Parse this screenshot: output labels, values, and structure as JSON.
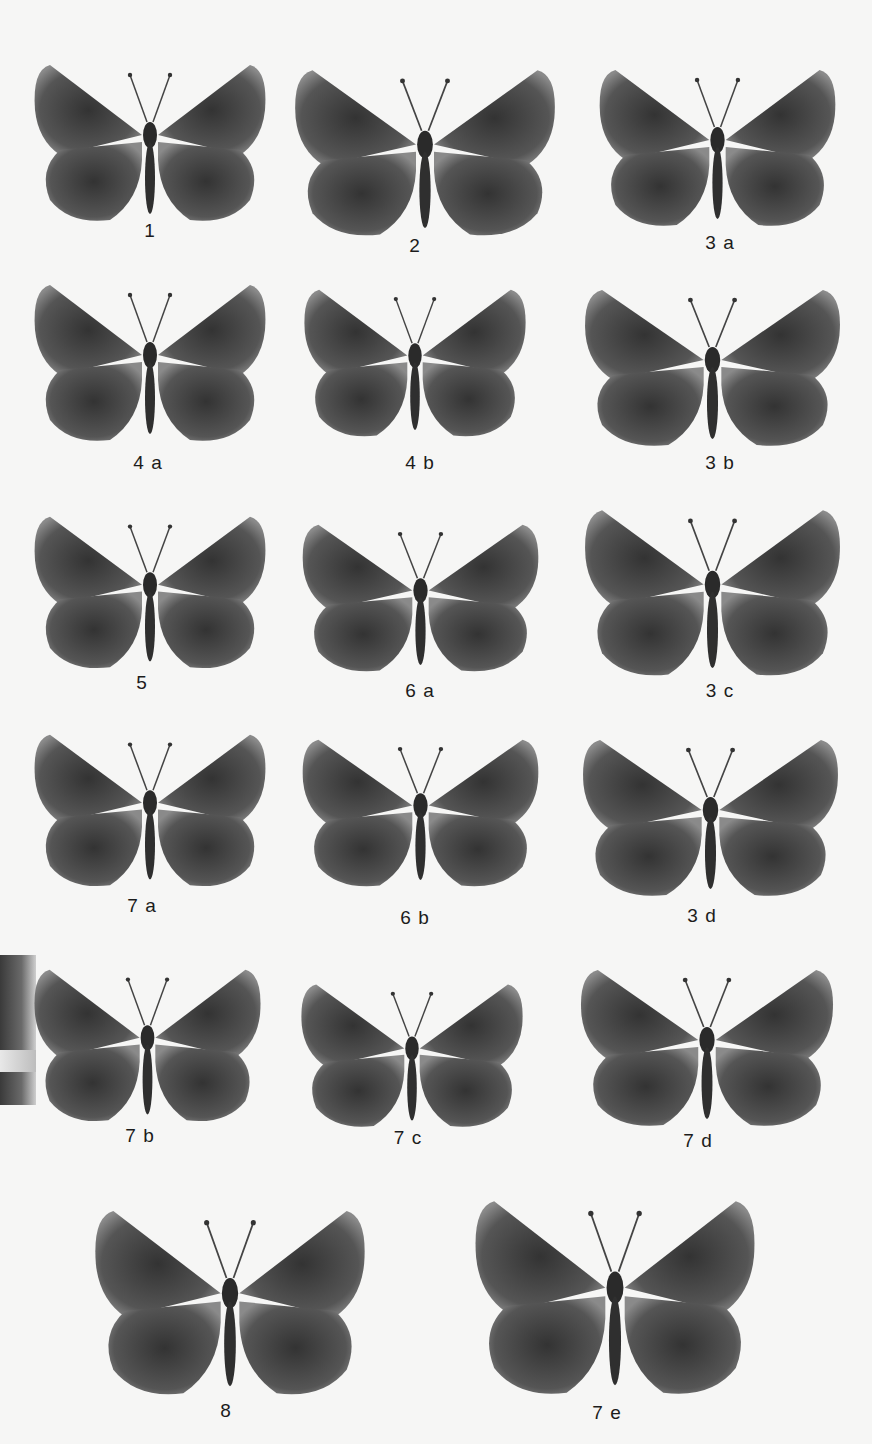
{
  "plate": {
    "colors": {
      "background": "#f6f6f5",
      "wing": "#5a5a5a",
      "wing_dark": "#3b3b3b",
      "label": "#1c1c1c"
    },
    "specimens": [
      {
        "label": "1",
        "x": 30,
        "y": 60,
        "w": 240,
        "h": 170,
        "lx": 120,
        "ly": 220
      },
      {
        "label": "2",
        "x": 290,
        "y": 65,
        "w": 270,
        "h": 180,
        "lx": 385,
        "ly": 235
      },
      {
        "label": "3 a",
        "x": 595,
        "y": 65,
        "w": 245,
        "h": 170,
        "lx": 690,
        "ly": 232
      },
      {
        "label": "4 a",
        "x": 30,
        "y": 280,
        "w": 240,
        "h": 170,
        "lx": 118,
        "ly": 452
      },
      {
        "label": "4 b",
        "x": 300,
        "y": 285,
        "w": 230,
        "h": 160,
        "lx": 390,
        "ly": 452
      },
      {
        "label": "3 b",
        "x": 580,
        "y": 285,
        "w": 265,
        "h": 170,
        "lx": 690,
        "ly": 452
      },
      {
        "label": "5",
        "x": 30,
        "y": 512,
        "w": 240,
        "h": 165,
        "lx": 112,
        "ly": 672
      },
      {
        "label": "6 a",
        "x": 298,
        "y": 520,
        "w": 245,
        "h": 160,
        "lx": 390,
        "ly": 680
      },
      {
        "label": "3 c",
        "x": 580,
        "y": 505,
        "w": 265,
        "h": 180,
        "lx": 690,
        "ly": 680
      },
      {
        "label": "7 a",
        "x": 30,
        "y": 730,
        "w": 240,
        "h": 165,
        "lx": 112,
        "ly": 895
      },
      {
        "label": "6 b",
        "x": 298,
        "y": 735,
        "w": 245,
        "h": 160,
        "lx": 385,
        "ly": 907
      },
      {
        "label": "3 d",
        "x": 578,
        "y": 735,
        "w": 265,
        "h": 170,
        "lx": 672,
        "ly": 905
      },
      {
        "label": "7 b",
        "x": 30,
        "y": 965,
        "w": 235,
        "h": 165,
        "lx": 110,
        "ly": 1125
      },
      {
        "label": "7 c",
        "x": 297,
        "y": 980,
        "w": 230,
        "h": 155,
        "lx": 378,
        "ly": 1127
      },
      {
        "label": "7 d",
        "x": 576,
        "y": 965,
        "w": 262,
        "h": 170,
        "lx": 668,
        "ly": 1130
      },
      {
        "label": "8",
        "x": 90,
        "y": 1205,
        "w": 280,
        "h": 200,
        "lx": 196,
        "ly": 1400
      },
      {
        "label": "7 e",
        "x": 470,
        "y": 1195,
        "w": 290,
        "h": 210,
        "lx": 577,
        "ly": 1402
      }
    ]
  }
}
